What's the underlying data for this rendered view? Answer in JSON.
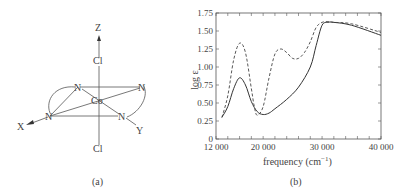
{
  "panel_a": {
    "caption": "(a)",
    "atoms": {
      "center": "Co",
      "axial_top": "Cl",
      "axial_bottom": "Cl",
      "n1": "N",
      "n2": "N",
      "n3": "N",
      "n4": "N"
    },
    "axes": {
      "z": "Z",
      "x": "X",
      "y": "Y"
    }
  },
  "panel_b": {
    "caption": "(b)",
    "xlabel": "frequency (cm",
    "xlabel_sup": "−1",
    "xlabel_close": ")",
    "ylabel": "log ε"
  },
  "chart_data": {
    "type": "line",
    "title": "",
    "xlabel": "frequency (cm⁻¹)",
    "ylabel": "log ε",
    "xlim": [
      12000,
      40000
    ],
    "ylim": [
      0,
      1.75
    ],
    "xticks": [
      "12 000",
      "20 000",
      "30 000",
      "40 000"
    ],
    "yticks": [
      "0",
      "0.25",
      "0.50",
      "0.75",
      "1.00",
      "1.25",
      "1.50",
      "1.75"
    ],
    "grid": false,
    "series": [
      {
        "name": "solid",
        "style": "solid",
        "x": [
          13000,
          14000,
          15000,
          16000,
          17000,
          18000,
          19000,
          20000,
          21000,
          22000,
          24000,
          26000,
          28000,
          29000,
          30000,
          31000,
          32000,
          35000,
          40000
        ],
        "y": [
          0.3,
          0.45,
          0.7,
          0.85,
          0.75,
          0.52,
          0.38,
          0.34,
          0.36,
          0.42,
          0.55,
          0.72,
          1.0,
          1.3,
          1.58,
          1.62,
          1.62,
          1.58,
          1.44
        ]
      },
      {
        "name": "dashed",
        "style": "dashed",
        "x": [
          13000,
          14000,
          15000,
          16000,
          17000,
          18000,
          18500,
          19000,
          20000,
          21000,
          22000,
          23000,
          24000,
          25000,
          26000,
          27000,
          28000,
          29000,
          30000,
          31000,
          32000,
          35000,
          40000
        ],
        "y": [
          0.3,
          0.6,
          1.1,
          1.33,
          1.2,
          0.7,
          0.45,
          0.33,
          0.45,
          0.85,
          1.18,
          1.25,
          1.2,
          1.12,
          1.12,
          1.2,
          1.35,
          1.55,
          1.62,
          1.63,
          1.62,
          1.6,
          1.48
        ]
      }
    ]
  }
}
